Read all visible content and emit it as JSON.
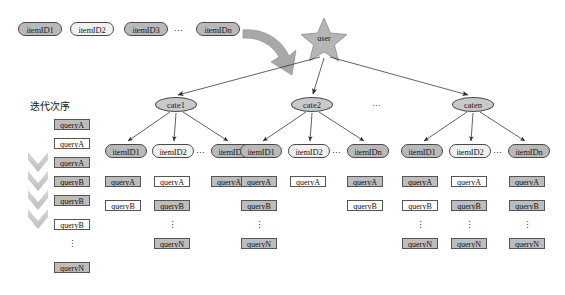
{
  "figure": {
    "background": "#ffffff",
    "node_fill_gray": "#b9b9b9",
    "node_fill_light": "#f0f0f0",
    "cate_fill": "#c9c9c9",
    "query_fill_gray": "#bdbdbd",
    "query_fill_white": "#ffffff",
    "star_fill": "#b5b5b5",
    "arrow_fill": "#a8a8a8",
    "chevron_fill": "#cfcfcf",
    "stroke": "#4a4a4a"
  },
  "top_row": {
    "items": [
      {
        "label": "itemID1",
        "fill": "gray",
        "x": 18,
        "y": 22,
        "w": 44
      },
      {
        "label": "itemID2",
        "fill": "light",
        "x": 70,
        "y": 22,
        "w": 44
      },
      {
        "label": "itemID3",
        "fill": "gray",
        "x": 124,
        "y": 22,
        "w": 44
      },
      {
        "label": "itemIDn",
        "fill": "gray",
        "x": 196,
        "y": 22,
        "w": 44
      }
    ],
    "ellipsis": {
      "label": "⋯",
      "x": 174,
      "y": 27
    }
  },
  "big_arrow": {
    "name": "curved-arrow"
  },
  "user": {
    "label": "user",
    "x": 307,
    "y": 34
  },
  "iteration": {
    "title": "迭代次序",
    "title_x": 30,
    "title_y": 101,
    "chevrons": [
      {
        "x": 28,
        "y": 152
      },
      {
        "x": 28,
        "y": 171
      },
      {
        "x": 28,
        "y": 190
      },
      {
        "x": 28,
        "y": 209
      }
    ],
    "queries": [
      {
        "label": "queryA",
        "fill": "gray",
        "x": 54,
        "y": 119
      },
      {
        "label": "queryA",
        "fill": "white",
        "x": 54,
        "y": 138
      },
      {
        "label": "queryA",
        "fill": "gray",
        "x": 54,
        "y": 157
      },
      {
        "label": "queryB",
        "fill": "gray",
        "x": 54,
        "y": 176
      },
      {
        "label": "queryB",
        "fill": "gray",
        "x": 54,
        "y": 195
      },
      {
        "label": "queryB",
        "fill": "white",
        "x": 54,
        "y": 219
      },
      {
        "label": "queryN",
        "fill": "gray",
        "x": 54,
        "y": 262
      }
    ],
    "vdots": {
      "label": "⋮",
      "x": 54,
      "y": 240
    }
  },
  "categories": [
    {
      "label": "cate1",
      "x": 155,
      "y": 97,
      "items": [
        {
          "label": "itemID1",
          "fill": "gray",
          "x": 105,
          "y": 144,
          "w": 42,
          "queries": [
            {
              "label": "queryA",
              "fill": "gray",
              "y": 176
            },
            {
              "label": "queryB",
              "fill": "white",
              "y": 200
            }
          ],
          "vdots": null,
          "last": null
        },
        {
          "label": "itemID2",
          "fill": "light",
          "x": 152,
          "y": 144,
          "w": 42,
          "queries": [
            {
              "label": "queryA",
              "fill": "white",
              "y": 176
            },
            {
              "label": "queryB",
              "fill": "gray",
              "y": 200
            }
          ],
          "vdots": {
            "label": "⋮",
            "y": 221
          },
          "last": {
            "label": "queryN",
            "fill": "gray",
            "y": 238
          }
        },
        {
          "label": "itemIDn",
          "fill": "gray",
          "x": 211,
          "y": 144,
          "w": 42,
          "queries": [
            {
              "label": "queryA",
              "fill": "gray",
              "y": 176
            }
          ],
          "vdots": null,
          "last": null
        }
      ],
      "item_ellipsis": {
        "label": "⋯",
        "x": 196,
        "y": 149
      }
    },
    {
      "label": "cate2",
      "x": 291,
      "y": 97,
      "items": [
        {
          "label": "itemID1",
          "fill": "gray",
          "x": 240,
          "y": 144,
          "w": 42,
          "queries": [
            {
              "label": "queryA",
              "fill": "gray",
              "y": 176
            },
            {
              "label": "queryB",
              "fill": "gray",
              "y": 200
            }
          ],
          "vdots": {
            "label": "⋮",
            "y": 221
          },
          "last": {
            "label": "queryN",
            "fill": "gray",
            "y": 238
          }
        },
        {
          "label": "itemID2",
          "fill": "light",
          "x": 288,
          "y": 144,
          "w": 42,
          "queries": [
            {
              "label": "queryA",
              "fill": "white",
              "y": 176
            }
          ],
          "vdots": null,
          "last": null
        },
        {
          "label": "itemIDn",
          "fill": "gray",
          "x": 347,
          "y": 144,
          "w": 42,
          "queries": [
            {
              "label": "queryA",
              "fill": "gray",
              "y": 176
            },
            {
              "label": "queryB",
              "fill": "white",
              "y": 200
            }
          ],
          "vdots": null,
          "last": null
        }
      ],
      "item_ellipsis": {
        "label": "⋯",
        "x": 332,
        "y": 149
      }
    },
    {
      "label": "caten",
      "x": 452,
      "y": 97,
      "items": [
        {
          "label": "itemID1",
          "fill": "gray",
          "x": 401,
          "y": 144,
          "w": 42,
          "queries": [
            {
              "label": "queryA",
              "fill": "gray",
              "y": 176
            },
            {
              "label": "queryB",
              "fill": "white",
              "y": 200
            }
          ],
          "vdots": {
            "label": "⋮",
            "y": 221
          },
          "last": {
            "label": "queryN",
            "fill": "gray",
            "y": 238
          }
        },
        {
          "label": "itemID2",
          "fill": "light",
          "x": 449,
          "y": 144,
          "w": 42,
          "queries": [
            {
              "label": "queryA",
              "fill": "white",
              "y": 176
            },
            {
              "label": "queryB",
              "fill": "gray",
              "y": 200
            }
          ],
          "vdots": {
            "label": "⋮",
            "y": 221
          },
          "last": {
            "label": "queryN",
            "fill": "gray",
            "y": 238
          }
        },
        {
          "label": "itemIDn",
          "fill": "gray",
          "x": 508,
          "y": 144,
          "w": 42,
          "queries": [
            {
              "label": "queryA",
              "fill": "gray",
              "y": 176
            },
            {
              "label": "queryB",
              "fill": "gray",
              "y": 200
            }
          ],
          "vdots": {
            "label": "⋮",
            "y": 221
          },
          "last": {
            "label": "queryN",
            "fill": "gray",
            "y": 238
          }
        }
      ],
      "item_ellipsis": {
        "label": "⋯",
        "x": 493,
        "y": 149
      }
    }
  ],
  "cate_ellipsis": {
    "label": "⋯",
    "x": 372,
    "y": 102
  }
}
